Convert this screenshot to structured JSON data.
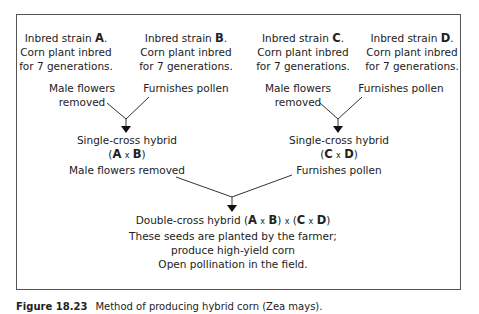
{
  "strains": [
    {
      "prefix": "Inbred strain ",
      "letter": "A",
      "suffix": ".",
      "line2": "Corn plant inbred",
      "line3": "for 7 generations."
    },
    {
      "prefix": "Inbred strain ",
      "letter": "B",
      "suffix": ".",
      "line2": "Corn plant inbred",
      "line3": "for 7 generations."
    },
    {
      "prefix": "Inbred strain ",
      "letter": "C",
      "suffix": ".",
      "line2": "Corn plant inbred",
      "line3": "for 7 generations."
    },
    {
      "prefix": "Inbred strain ",
      "letter": "D",
      "suffix": ".",
      "line2": "Corn plant inbred",
      "line3": "for 7 generations."
    }
  ],
  "roles": {
    "left_female_line1": "Male flowers",
    "left_female_line2": "removed",
    "left_male": "Furnishes pollen",
    "right_female_line1": "Male flowers",
    "right_female_line2": "removed",
    "right_male": "Furnishes pollen"
  },
  "single_cross_left": {
    "title": "Single-cross hybrid",
    "open": "(",
    "a": "A",
    "times": "x",
    "b": "B",
    "close": ")",
    "role": "Male flowers removed"
  },
  "single_cross_right": {
    "title": "Single-cross hybrid",
    "open": "(",
    "a": "C",
    "times": "x",
    "b": "D",
    "close": ")",
    "role": "Furnishes pollen"
  },
  "double_cross": {
    "title_prefix": "Double-cross hybrid ",
    "p1": "(",
    "a": "A",
    "x1": "x",
    "b": "B",
    "p2": ")",
    "x_mid": "x",
    "p3": "(",
    "c": "C",
    "x2": "x",
    "d": "D",
    "p4": ")",
    "line2": "These seeds are planted by the farmer;",
    "line3": "produce high-yield corn",
    "line4": "Open pollination in the field."
  },
  "caption": {
    "number": "Figure 18.23",
    "text": "Method of producing hybrid corn (Zea mays)."
  }
}
